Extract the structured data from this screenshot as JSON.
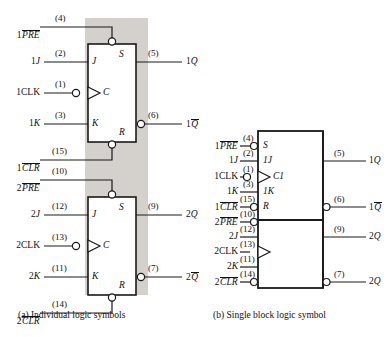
{
  "figure": {
    "title_a": "(a)  Individual logic symbols",
    "title_b": "(b)  Single block logic symbol",
    "colors": {
      "line": "#1a1a1a",
      "shade": "#d4d0cc",
      "background": "#ffffff"
    }
  },
  "panel_a": {
    "caption": "(a)  Individual logic symbols",
    "flipflop1": {
      "inner_labels": {
        "s": "S",
        "j": "J",
        "c": "C",
        "k": "K",
        "r": "R"
      },
      "inputs": [
        {
          "name": "1PRE",
          "prefix": "1",
          "over": "PRE",
          "pin": "(4)",
          "bubble": true
        },
        {
          "name": "1J",
          "prefix": "1",
          "over": "",
          "italic_tail": "J",
          "pin": "(2)",
          "bubble": false
        },
        {
          "name": "1CLK",
          "prefix": "1CLK",
          "over": "",
          "pin": "(1)",
          "bubble": true
        },
        {
          "name": "1K",
          "prefix": "1",
          "italic_tail": "K",
          "over": "",
          "pin": "(3)",
          "bubble": false
        },
        {
          "name": "1CLR",
          "prefix": "1",
          "over": "CLR",
          "pin": "(15)",
          "bubble": true
        }
      ],
      "outputs": [
        {
          "name": "1Q",
          "prefix": "1",
          "italic_tail": "Q",
          "over": "",
          "pin": "(5)",
          "bubble": false
        },
        {
          "name": "1Qbar",
          "prefix": "1",
          "over_italic": "Q",
          "pin": "(6)",
          "bubble": true
        }
      ]
    },
    "flipflop2": {
      "inner_labels": {
        "s": "S",
        "j": "J",
        "c": "C",
        "k": "K",
        "r": "R"
      },
      "inputs": [
        {
          "name": "2PRE",
          "prefix": "2",
          "over": "PRE",
          "pin": "(10)",
          "bubble": true
        },
        {
          "name": "2J",
          "prefix": "2",
          "italic_tail": "J",
          "over": "",
          "pin": "(12)",
          "bubble": false
        },
        {
          "name": "2CLK",
          "prefix": "2CLK",
          "over": "",
          "pin": "(13)",
          "bubble": true
        },
        {
          "name": "2K",
          "prefix": "2",
          "italic_tail": "K",
          "over": "",
          "pin": "(11)",
          "bubble": false
        },
        {
          "name": "2CLR",
          "prefix": "2",
          "over": "CLR",
          "pin": "(14)",
          "bubble": true
        }
      ],
      "outputs": [
        {
          "name": "2Q",
          "prefix": "2",
          "italic_tail": "Q",
          "over": "",
          "pin": "(9)",
          "bubble": false
        },
        {
          "name": "2Qbar",
          "prefix": "2",
          "over_italic": "Q",
          "pin": "(7)",
          "bubble": true
        }
      ]
    }
  },
  "panel_b": {
    "caption": "(b)  Single block logic symbol",
    "inner_labels": {
      "s": "S",
      "j1": "1J",
      "c1": "C1",
      "k1": "1K",
      "r": "R"
    },
    "inputs": [
      {
        "name": "1PRE",
        "prefix": "1",
        "over": "PRE",
        "pin": "(4)",
        "bubble": true
      },
      {
        "name": "1J",
        "prefix": "1",
        "italic_tail": "J",
        "over": "",
        "pin": "(2)",
        "bubble": false
      },
      {
        "name": "1CLK",
        "prefix": "1CLK",
        "over": "",
        "pin": "(1)",
        "bubble": true
      },
      {
        "name": "1K",
        "prefix": "1",
        "italic_tail": "K",
        "over": "",
        "pin": "(3)",
        "bubble": false
      },
      {
        "name": "1CLR",
        "prefix": "1",
        "over": "CLR",
        "pin": "(15)",
        "bubble": true
      },
      {
        "name": "2PRE",
        "prefix": "2",
        "over": "PRE",
        "pin": "(10)",
        "bubble": true
      },
      {
        "name": "2J",
        "prefix": "2",
        "italic_tail": "J",
        "over": "",
        "pin": "(12)",
        "bubble": false
      },
      {
        "name": "2CLK",
        "prefix": "2CLK",
        "over": "",
        "pin": "(13)",
        "bubble": false
      },
      {
        "name": "2K",
        "prefix": "2",
        "italic_tail": "K",
        "over": "",
        "pin": "(11)",
        "bubble": false
      },
      {
        "name": "2CLR",
        "prefix": "2",
        "over": "CLR",
        "pin": "(14)",
        "bubble": true
      }
    ],
    "outputs": [
      {
        "name": "1Q",
        "prefix": "1",
        "italic_tail": "Q",
        "over": "",
        "pin": "(5)",
        "bubble": false
      },
      {
        "name": "1Qbar",
        "prefix": "1",
        "over_italic": "Q",
        "pin": "(6)",
        "bubble": true
      },
      {
        "name": "2Q",
        "prefix": "2",
        "italic_tail": "Q",
        "over": "",
        "pin": "(9)",
        "bubble": false
      },
      {
        "name": "2Qbar",
        "prefix": "2",
        "italic_tail": "Q",
        "over": "",
        "pin": "(7)",
        "bubble": true
      }
    ]
  }
}
